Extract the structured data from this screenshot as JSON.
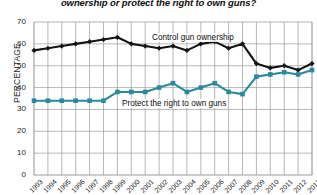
{
  "chart_data": {
    "type": "line",
    "title": "ownership or protect the right to own guns?",
    "xlabel": "",
    "ylabel": "PERCENTAGE",
    "ylim": [
      0,
      70
    ],
    "ytick_step": 10,
    "yticks": [
      "0",
      "10",
      "20",
      "30",
      "40",
      "50",
      "60",
      "70"
    ],
    "grid": true,
    "legend_position": "inline-annotation",
    "categories": [
      "1993",
      "1994",
      "1995",
      "1996",
      "1997",
      "1998",
      "1999",
      "2000",
      "2001",
      "2002",
      "2003",
      "2004",
      "2005",
      "2006",
      "2007",
      "2008",
      "2009",
      "2010",
      "2011",
      "2012",
      "2013"
    ],
    "series": [
      {
        "name": "Control gun ownership",
        "color": "#141414",
        "marker": "diamond",
        "values": [
          57,
          58,
          59,
          60,
          61,
          62,
          63,
          60,
          59,
          58,
          59,
          57,
          60,
          61,
          58,
          60,
          51,
          49,
          50,
          48,
          51
        ]
      },
      {
        "name": "Protect the right to own guns",
        "color": "#2b8a99",
        "marker": "square",
        "values": [
          34,
          34,
          34,
          34,
          34,
          34,
          38,
          38,
          38,
          40,
          42,
          38,
          40,
          42,
          38,
          37,
          45,
          46,
          47,
          46,
          48
        ]
      }
    ],
    "annotations": [
      {
        "text": "Control gun ownership",
        "series": "Control gun ownership"
      },
      {
        "text": "Protect the right to own guns",
        "series": "Protect the right to own guns"
      }
    ]
  }
}
